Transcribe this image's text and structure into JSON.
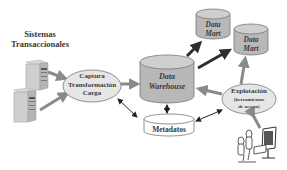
{
  "diagram": {
    "source_systems": {
      "label_line1": "Sistemas",
      "label_line2": "Transaccionales",
      "icon": "server-icon",
      "count": 2
    },
    "etl": {
      "line1": "Captura",
      "line2": "Transformación",
      "line3": "Carga"
    },
    "warehouse": {
      "line1": "Data",
      "line2": "Warehouse"
    },
    "data_marts": [
      {
        "line1": "Data",
        "line2": "Mart"
      },
      {
        "line1": "Data",
        "line2": "Mart"
      }
    ],
    "exploitation": {
      "line1": "Explotación",
      "line2": "(herramientas",
      "line3": "de acceso)"
    },
    "metadata": {
      "label": "Metadatos"
    },
    "users": {
      "icon": "users-at-computer-icon"
    }
  },
  "colors": {
    "cylinder_fill": "#b8b8b8",
    "cylinder_top": "#cfcfcf",
    "ellipse_fill": "#e6e6e6",
    "arrow_dark": "#2e2e2e",
    "arrow_gray": "#8a8a8a",
    "text": "#3a3a3a"
  }
}
